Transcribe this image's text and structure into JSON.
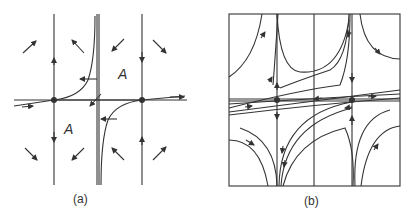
{
  "figure": {
    "panels": [
      {
        "id": "a",
        "label": "(a)",
        "region_labels": [
          "A",
          "A"
        ]
      },
      {
        "id": "b",
        "label": "(b)"
      }
    ],
    "colors": {
      "line": "#333333",
      "background": "#ffffff"
    }
  }
}
